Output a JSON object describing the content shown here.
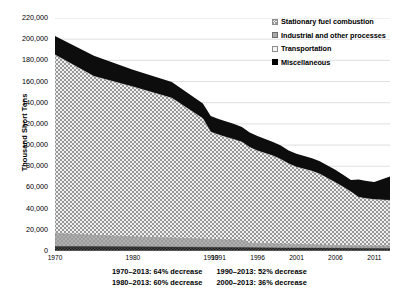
{
  "chart_data": {
    "type": "area",
    "title": "",
    "xlabel": "",
    "ylabel": "Thousand Short Tons",
    "ylim": [
      0,
      220000
    ],
    "y_ticks": [
      0,
      20000,
      40000,
      60000,
      80000,
      100000,
      120000,
      140000,
      160000,
      180000,
      200000,
      220000
    ],
    "y_tick_labels": [
      "0",
      "20,000",
      "40,000",
      "60,000",
      "80,000",
      "100,000",
      "120,000",
      "140,000",
      "160,000",
      "180,000",
      "200,000",
      "220,000"
    ],
    "x_tick_labels": [
      "1970",
      "1980",
      "1990",
      "1991",
      "1996",
      "2001",
      "2006",
      "2011"
    ],
    "x_tick_values": [
      1970,
      1980,
      1990,
      1991,
      1996,
      2001,
      2006,
      2011
    ],
    "xlim": [
      1970,
      2013
    ],
    "grid": "horizontal",
    "legend_position": "top-right",
    "stacking": "stacked",
    "x": [
      1970,
      1975,
      1980,
      1985,
      1990,
      1991,
      1992,
      1993,
      1994,
      1995,
      1996,
      1997,
      1998,
      1999,
      2000,
      2001,
      2002,
      2003,
      2004,
      2005,
      2006,
      2007,
      2008,
      2009,
      2010,
      2011,
      2012,
      2013
    ],
    "series": [
      {
        "name": "Miscellaneous",
        "fill": "#000000",
        "values": [
          4200,
          4000,
          3800,
          3500,
          3200,
          3100,
          3050,
          3000,
          2950,
          2900,
          2850,
          2800,
          2800,
          2750,
          2700,
          2650,
          2600,
          2580,
          2550,
          2520,
          2500,
          2480,
          2460,
          2440,
          2420,
          2400,
          2380,
          2360
        ]
      },
      {
        "name": "Transportation",
        "fill": "#f4f4f4",
        "values": [
          12800,
          11500,
          10200,
          9000,
          8200,
          8000,
          7800,
          7600,
          7400,
          7200,
          5200,
          5000,
          4800,
          4600,
          4400,
          4200,
          4000,
          3800,
          3600,
          3400,
          3200,
          3000,
          2800,
          2600,
          2400,
          2300,
          2200,
          2100
        ]
      },
      {
        "name": "Industrial and other processes",
        "fill": "#eeeeee",
        "values": [
          166000,
          158000,
          153000,
          142000,
          125000,
          110000,
          107000,
          104000,
          102000,
          99000,
          94000,
          90000,
          87000,
          84000,
          80000,
          76000,
          73000,
          71000,
          69000,
          66000,
          62000,
          58000,
          53000,
          48000,
          47000,
          45000,
          44000,
          45000
        ]
      },
      {
        "name": "Stationary fuel combustion",
        "fill": "#141414",
        "values": [
          20000,
          19500,
          17000,
          15500,
          13600,
          13400,
          13000,
          12900,
          12500,
          12200,
          12000,
          12500,
          12700,
          13000,
          13600,
          12500,
          12800,
          13000,
          13000,
          13000,
          12500,
          12000,
          11500,
          11000,
          15000,
          16000,
          16500,
          23000
        ]
      }
    ],
    "legend": [
      {
        "label": "Stationary fuel combustion",
        "swatch": "checkered-gray"
      },
      {
        "label": "Industrial and other processes",
        "swatch": "solid-gray"
      },
      {
        "label": "Transportation",
        "swatch": "light-gray"
      },
      {
        "label": "Miscellaneous",
        "swatch": "black"
      }
    ],
    "annotations": [
      "1970–2013: 64% decrease",
      "1980–2013: 60% decrease",
      "1990–2013: 52% decrease",
      "2000–2013: 36% decrease"
    ]
  },
  "caption": {
    "column_left": [
      "1970–2013: 64% decrease",
      "1980–2013: 60% decrease"
    ],
    "column_right": [
      "1990–2013: 52% decrease",
      "2000–2013: 36% decrease"
    ]
  }
}
